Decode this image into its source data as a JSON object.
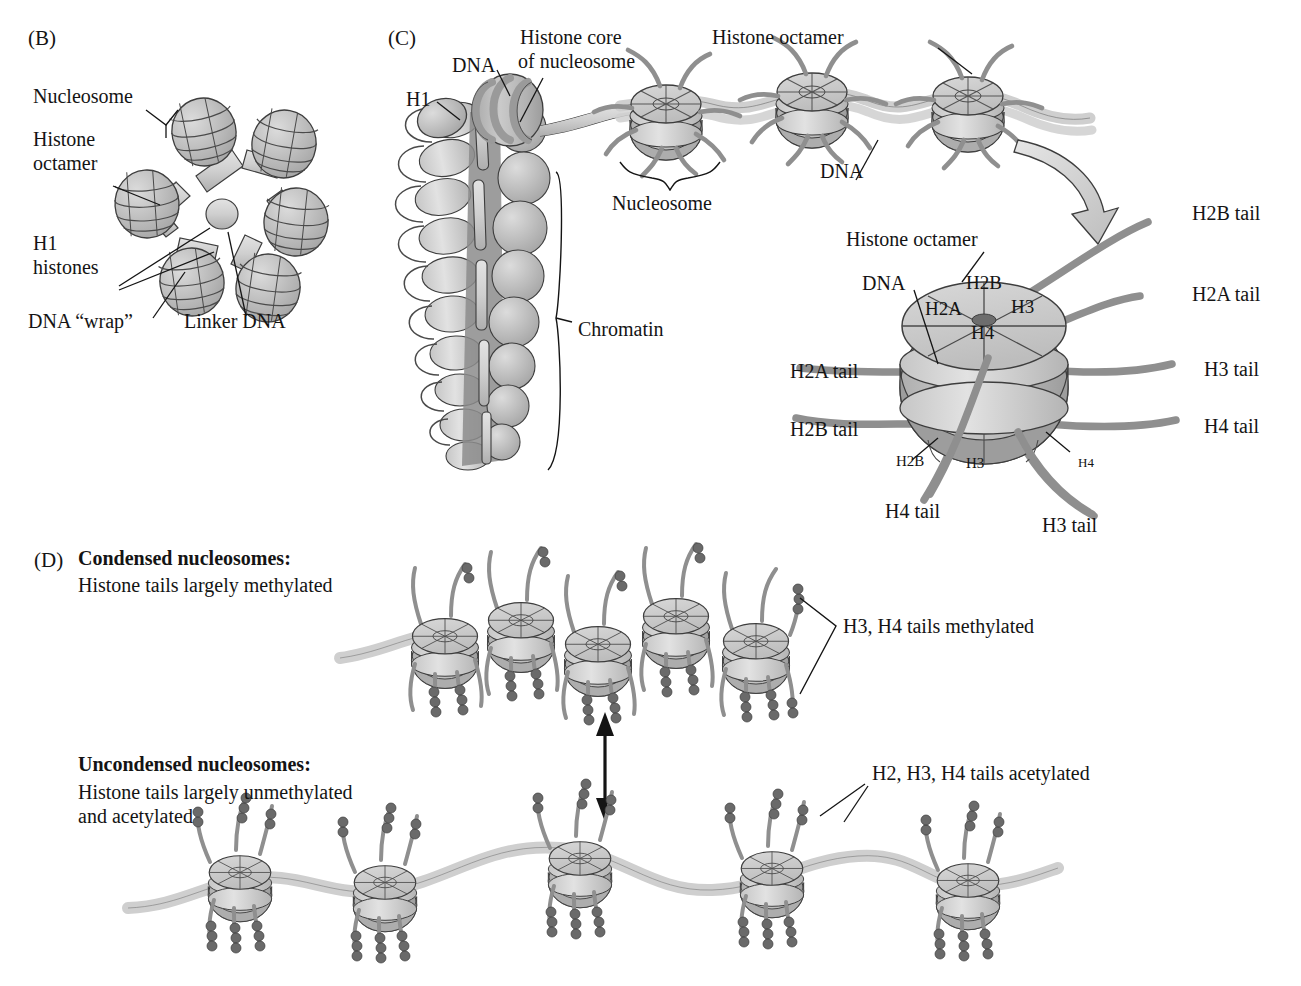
{
  "figure": {
    "type": "biology-diagram",
    "panels": [
      "(B)",
      "(C)",
      "(D)"
    ]
  },
  "panel_b": {
    "tag": "(B)",
    "labels": {
      "nucleosome": "Nucleosome",
      "histone_octamer_line1": "Histone",
      "histone_octamer_line2": "octamer",
      "h1_line1": "H1",
      "h1_line2": "histones",
      "dna_wrap": "DNA “wrap”",
      "linker_dna": "Linker DNA"
    },
    "nucleosome_count": 6
  },
  "panel_c": {
    "tag": "(C)",
    "labels": {
      "h1": "H1",
      "dna_top": "DNA",
      "histone_core_line1": "Histone core",
      "histone_core_line2": "of nucleosome",
      "histone_octamer_top": "Histone octamer",
      "nucleosome_brace": "Nucleosome",
      "dna_chain": "DNA",
      "chromatin": "Chromatin"
    },
    "chain_nucleosome_count": 3,
    "detail": {
      "labels": {
        "histone_octamer": "Histone octamer",
        "dna": "DNA",
        "h2b_tail_top": "H2B tail",
        "h2a_tail_right": "H2A tail",
        "h3_tail_right": "H3 tail",
        "h4_tail_right": "H4 tail",
        "h2a_tail_left": "H2A tail",
        "h2b_tail_left": "H2B tail",
        "h4_tail_bottom": "H4 tail",
        "h3_tail_bottom": "H3 tail",
        "core_h2a": "H2A",
        "core_h2b": "H2B",
        "core_h3": "H3",
        "core_h4": "H4",
        "side_h2b": "H2B",
        "side_h3": "H3",
        "side_h4": "H4"
      }
    }
  },
  "panel_d": {
    "tag": "(D)",
    "condensed": {
      "title": "Condensed nucleosomes:",
      "subtitle": "Histone tails largely methylated",
      "callout": "H3, H4 tails methylated",
      "nucleosome_count": 5
    },
    "uncondensed": {
      "title": "Uncondensed nucleosomes:",
      "subtitle_line1": "Histone tails largely unmethylated",
      "subtitle_line2": "and acetylated",
      "callout": "H2, H3, H4 tails acetylated",
      "nucleosome_count": 5
    }
  },
  "colors": {
    "ink": "#141414",
    "histone_top": "#c9c9c9",
    "histone_mid": "#b6b6b6",
    "histone_dark": "#9d9d9d",
    "dna_ribbon": "#cfcfcf",
    "tail": "#8f8f8f",
    "mark_bead": "#6a6a6a",
    "outline": "#3d3d3d",
    "background": "#ffffff"
  }
}
